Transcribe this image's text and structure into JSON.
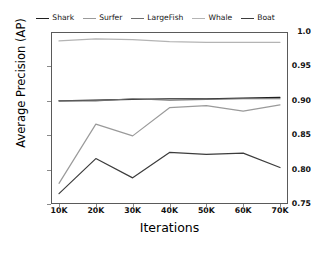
{
  "chart_data": {
    "type": "line",
    "title": "",
    "xlabel": "Iterations",
    "ylabel": "Average Precision (AP)",
    "x": [
      "10K",
      "20K",
      "30K",
      "40K",
      "50K",
      "60K",
      "70K"
    ],
    "xlim": [
      0,
      6
    ],
    "ylim": [
      0.75,
      1.0
    ],
    "yticks": [
      "1.0",
      "0.95",
      "0.90",
      "0.85",
      "0.80",
      "0.75"
    ],
    "ytick_values": [
      1.0,
      0.95,
      0.9,
      0.85,
      0.8,
      0.75
    ],
    "grid": false,
    "legend_position": "top-center",
    "series": [
      {
        "name": "Shark",
        "color": "#1f1f1f",
        "values": [
          0.9,
          0.901,
          0.902,
          0.903,
          0.903,
          0.904,
          0.905
        ]
      },
      {
        "name": "Surfer",
        "color": "#9a9a9a",
        "values": [
          0.78,
          0.866,
          0.849,
          0.89,
          0.893,
          0.885,
          0.894
        ]
      },
      {
        "name": "LargeFish",
        "color": "#6e6e6e",
        "values": [
          0.9,
          0.9,
          0.903,
          0.901,
          0.902,
          0.903,
          0.903
        ]
      },
      {
        "name": "Whale",
        "color": "#b4b4b4",
        "values": [
          0.987,
          0.99,
          0.989,
          0.986,
          0.985,
          0.985,
          0.985
        ]
      },
      {
        "name": "Boat",
        "color": "#3c3c3c",
        "values": [
          0.765,
          0.816,
          0.788,
          0.825,
          0.822,
          0.824,
          0.803
        ]
      }
    ]
  },
  "legend": {
    "items": [
      {
        "label": "Shark"
      },
      {
        "label": "Surfer"
      },
      {
        "label": "LargeFish"
      },
      {
        "label": "Whale"
      },
      {
        "label": "Boat"
      }
    ]
  },
  "axes": {
    "y_title": "Average Precision (AP)",
    "x_title": "Iterations",
    "y_labels": [
      "1.0",
      "0.95",
      "0.90",
      "0.85",
      "0.80",
      "0.75"
    ],
    "x_labels": [
      "10K",
      "20K",
      "30K",
      "40K",
      "50K",
      "60K",
      "70K"
    ]
  }
}
